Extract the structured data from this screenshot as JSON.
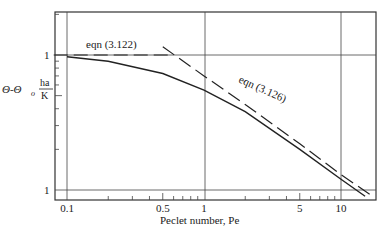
{
  "chart_data": {
    "type": "line",
    "title": "",
    "xlabel": "Peclet number, Pe",
    "ylabel": "Θ-Θo ha/K",
    "ylabel_parts": {
      "left": "Θ-Θ",
      "sub": "o",
      "num": "ha",
      "den": "K"
    },
    "xscale": "log",
    "yscale": "log",
    "xlim": [
      0.08,
      20
    ],
    "ylim": [
      0.1,
      2.5
    ],
    "x_ticks": [
      "0.1",
      "0.5",
      "1",
      "5",
      "10"
    ],
    "y_ticks": [
      "0.1",
      "1"
    ],
    "y_tick_labels_visible": [
      "1",
      "1"
    ],
    "grid": "major decades (x=0.1,1,10; y=0.1,1)",
    "series": [
      {
        "name": "exact solution",
        "style": "solid",
        "x": [
          0.1,
          0.2,
          0.5,
          1,
          2,
          5,
          10,
          15
        ],
        "y": [
          0.97,
          0.9,
          0.73,
          0.55,
          0.38,
          0.2,
          0.12,
          0.09
        ]
      },
      {
        "name": "eqn (3.122)",
        "style": "dashed",
        "x": [
          0.08,
          0.6
        ],
        "y": [
          1.0,
          1.0
        ]
      },
      {
        "name": "eqn (3.126)",
        "style": "dashed",
        "x": [
          0.5,
          1,
          2,
          5,
          10,
          17
        ],
        "y": [
          1.15,
          0.7,
          0.43,
          0.22,
          0.13,
          0.09
        ]
      }
    ],
    "annotations": [
      {
        "text": "eqn (3.122)",
        "near": "horizontal dashed line at y=1"
      },
      {
        "text": "eqn (3.126)",
        "near": "sloped dashed asymptote"
      }
    ]
  }
}
